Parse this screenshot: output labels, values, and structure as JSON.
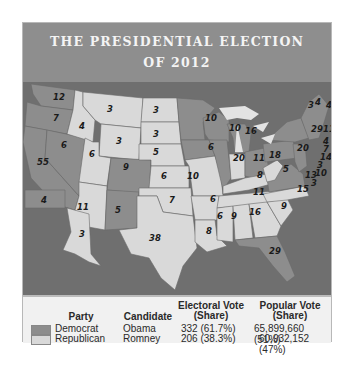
{
  "title": {
    "line1": "THE PRESIDENTIAL ELECTION",
    "line2": "OF 2012"
  },
  "colors": {
    "democrat": "#8d8d8d",
    "republican": "#d9d9d9",
    "water": "#6f6f6f",
    "title_bg": "#8e8e8e"
  },
  "map": {
    "states": [
      {
        "state": "WA",
        "votes": "12",
        "party": "Democrat"
      },
      {
        "state": "OR",
        "votes": "7",
        "party": "Democrat"
      },
      {
        "state": "CA",
        "votes": "55",
        "party": "Democrat"
      },
      {
        "state": "NV",
        "votes": "6",
        "party": "Democrat"
      },
      {
        "state": "ID",
        "votes": "4",
        "party": "Republican"
      },
      {
        "state": "MT",
        "votes": "3",
        "party": "Republican"
      },
      {
        "state": "WY",
        "votes": "3",
        "party": "Republican"
      },
      {
        "state": "UT",
        "votes": "6",
        "party": "Republican"
      },
      {
        "state": "AZ",
        "votes": "11",
        "party": "Republican"
      },
      {
        "state": "CO",
        "votes": "9",
        "party": "Democrat"
      },
      {
        "state": "NM",
        "votes": "5",
        "party": "Democrat"
      },
      {
        "state": "ND",
        "votes": "3",
        "party": "Republican"
      },
      {
        "state": "SD",
        "votes": "3",
        "party": "Republican"
      },
      {
        "state": "NE",
        "votes": "5",
        "party": "Republican"
      },
      {
        "state": "KS",
        "votes": "6",
        "party": "Republican"
      },
      {
        "state": "OK",
        "votes": "7",
        "party": "Republican"
      },
      {
        "state": "TX",
        "votes": "38",
        "party": "Republican"
      },
      {
        "state": "MN",
        "votes": "10",
        "party": "Democrat"
      },
      {
        "state": "IA",
        "votes": "6",
        "party": "Democrat"
      },
      {
        "state": "MO",
        "votes": "10",
        "party": "Republican"
      },
      {
        "state": "AR",
        "votes": "6",
        "party": "Republican"
      },
      {
        "state": "LA",
        "votes": "8",
        "party": "Republican"
      },
      {
        "state": "WI",
        "votes": "10",
        "party": "Democrat"
      },
      {
        "state": "IL",
        "votes": "20",
        "party": "Democrat"
      },
      {
        "state": "MI",
        "votes": "16",
        "party": "Democrat"
      },
      {
        "state": "IN",
        "votes": "11",
        "party": "Republican"
      },
      {
        "state": "OH",
        "votes": "18",
        "party": "Democrat"
      },
      {
        "state": "KY",
        "votes": "8",
        "party": "Republican"
      },
      {
        "state": "TN",
        "votes": "11",
        "party": "Republican"
      },
      {
        "state": "MS",
        "votes": "6",
        "party": "Republican"
      },
      {
        "state": "AL",
        "votes": "9",
        "party": "Republican"
      },
      {
        "state": "GA",
        "votes": "16",
        "party": "Republican"
      },
      {
        "state": "FL",
        "votes": "29",
        "party": "Democrat"
      },
      {
        "state": "SC",
        "votes": "9",
        "party": "Republican"
      },
      {
        "state": "NC",
        "votes": "15",
        "party": "Republican"
      },
      {
        "state": "VA",
        "votes": "13",
        "party": "Democrat"
      },
      {
        "state": "WV",
        "votes": "5",
        "party": "Republican"
      },
      {
        "state": "PA",
        "votes": "20",
        "party": "Democrat"
      },
      {
        "state": "NY",
        "votes": "29",
        "party": "Democrat"
      },
      {
        "state": "VT",
        "votes": "3",
        "party": "Democrat"
      },
      {
        "state": "NH",
        "votes": "4",
        "party": "Democrat"
      },
      {
        "state": "ME",
        "votes": "4",
        "party": "Democrat"
      },
      {
        "state": "MA",
        "votes": "11",
        "party": "Democrat"
      },
      {
        "state": "RI",
        "votes": "4",
        "party": "Democrat"
      },
      {
        "state": "CT",
        "votes": "7",
        "party": "Democrat"
      },
      {
        "state": "NJ",
        "votes": "14",
        "party": "Democrat"
      },
      {
        "state": "DE",
        "votes": "3",
        "party": "Democrat"
      },
      {
        "state": "MD",
        "votes": "10",
        "party": "Democrat"
      },
      {
        "state": "DC",
        "votes": "3",
        "party": "Democrat"
      },
      {
        "state": "HI",
        "votes": "4",
        "party": "Democrat"
      },
      {
        "state": "AK",
        "votes": "3",
        "party": "Republican"
      }
    ]
  },
  "legend": {
    "headers": {
      "party": "Party",
      "candidate": "Candidate",
      "electoral_line1": "Electoral Vote",
      "electoral_line2": "(Share)",
      "popular_line1": "Popular Vote",
      "popular_line2": "(Share)"
    },
    "rows": [
      {
        "party": "Democrat",
        "candidate": "Obama",
        "electoral": "332 (61.7%)",
        "popular": "65,899,660 (51%)"
      },
      {
        "party": "Republican",
        "candidate": "Romney",
        "electoral": "206 (38.3%)",
        "popular": "60,932,152 (47%)"
      }
    ]
  }
}
